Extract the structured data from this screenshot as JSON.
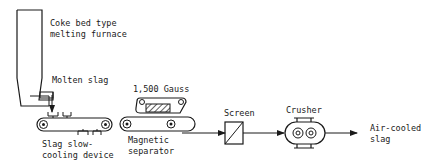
{
  "diagram": {
    "nodes": {
      "furnace": {
        "label_line1": "Coke bed type",
        "label_line2": "melting furnace"
      },
      "molten_slag": {
        "label": "Molten slag"
      },
      "slow_cooling": {
        "label_line1": "Slag slow-",
        "label_line2": "cooling device"
      },
      "magnet_strength": {
        "label": "1,500 Gauss"
      },
      "magnetic_separator": {
        "label_line1": "Magnetic",
        "label_line2": "separator"
      },
      "screen": {
        "label": "Screen"
      },
      "crusher": {
        "label": "Crusher"
      },
      "product": {
        "label_line1": "Air-cooled",
        "label_line2": "slag"
      }
    },
    "edges": [
      {
        "from": "furnace",
        "to": "slow_cooling",
        "label": "Molten slag"
      },
      {
        "from": "slow_cooling",
        "to": "magnetic_separator"
      },
      {
        "from": "magnetic_separator",
        "to": "screen"
      },
      {
        "from": "screen",
        "to": "crusher"
      },
      {
        "from": "crusher",
        "to": "product"
      }
    ]
  }
}
